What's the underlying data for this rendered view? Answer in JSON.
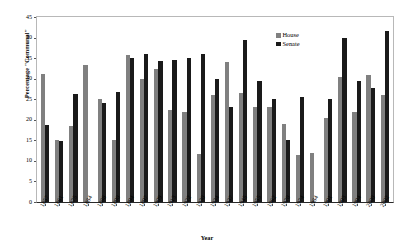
{
  "chart_data": {
    "type": "bar",
    "title": "",
    "xlabel": "Year",
    "ylabel": "Percentage \"Communal\"",
    "ylim": [
      0,
      45
    ],
    "yticks": [
      0,
      5,
      10,
      15,
      20,
      25,
      30,
      35,
      40,
      45
    ],
    "grid": false,
    "legend_position": "top-right",
    "categories": [
      "1857",
      "1861",
      "1875",
      "1884",
      "1888",
      "1890",
      "1894",
      "1897",
      "1909",
      "1913",
      "1922",
      "1930",
      "1934",
      "1937",
      "1945",
      "1955",
      "1962",
      "1970",
      "1974",
      "1984",
      "1991",
      "1993",
      "1994",
      "2000",
      "2002"
    ],
    "series": [
      {
        "name": "House",
        "color": "#808080",
        "values": [
          31.2,
          15.0,
          18.6,
          33.3,
          25.0,
          15.2,
          35.8,
          30.0,
          32.3,
          22.5,
          22.0,
          11.7,
          26.0,
          34.0,
          26.5,
          23.0,
          23.0,
          19.0,
          11.5,
          12.0,
          20.5,
          30.5,
          22.0,
          31.0,
          26.0
        ],
        "labels": [
          "31.2",
          "15.0",
          "18.6",
          "33.3",
          "25.0",
          "15.2",
          "35.8",
          "30.0",
          "32.3",
          "22.5",
          "22.0",
          "11.7",
          "26.0",
          "34.0",
          "26.5",
          "23.0",
          "23.0",
          "19.0",
          "11.5",
          "12.0",
          "20.5",
          "30.5",
          "22.0",
          "31.0",
          "26.0"
        ]
      },
      {
        "name": "Senate",
        "color": "#1a1a1a",
        "values": [
          18.7,
          14.8,
          26.3,
          0.0,
          24.2,
          26.8,
          35.0,
          36.0,
          34.3,
          34.5,
          35.0,
          36.0,
          30.0,
          23.2,
          39.5,
          29.5,
          25.0,
          15.0,
          25.5,
          0.0,
          25.0,
          40.0,
          29.5,
          27.8,
          41.5
        ],
        "labels": [
          "18.7",
          "14.8",
          "26.3",
          "",
          "24.2",
          "26.8",
          "35.0",
          "36.0",
          "34.3",
          "34.5",
          "35.0",
          "36.0",
          "30.0",
          "23.2",
          "39.5",
          "29.5",
          "25.0",
          "15.0",
          "25.5",
          "",
          "25.0",
          "40.0",
          "29.5",
          "27.8",
          "41.5"
        ]
      }
    ]
  },
  "legend": {
    "items": [
      {
        "label": "House",
        "color": "#808080"
      },
      {
        "label": "Senate",
        "color": "#1a1a1a"
      }
    ]
  },
  "axes": {
    "y_title": "Percentage \"Communal\"",
    "x_title": "Year"
  }
}
